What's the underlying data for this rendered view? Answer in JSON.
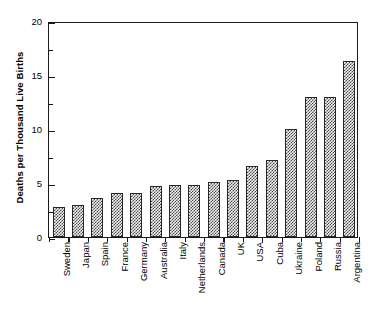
{
  "chart_data": {
    "type": "bar",
    "title": "",
    "xlabel": "",
    "ylabel": "Deaths per Thousand Live Births",
    "ylim": [
      0,
      20
    ],
    "ytick_values": [
      0,
      5,
      10,
      15,
      20
    ],
    "ytick_labels": [
      "0",
      "5",
      "10",
      "15",
      "20"
    ],
    "yminor_step": 2.5,
    "grid": false,
    "legend": null,
    "categories": [
      "Sweden",
      "Japan",
      "Spain",
      "France",
      "Germany",
      "Australia",
      "Italy",
      "Netherlands",
      "Canada",
      "UK",
      "USA",
      "Cuba",
      "Ukraine",
      "Poland",
      "Russia",
      "Argentina"
    ],
    "values": [
      2.8,
      3.0,
      3.6,
      4.1,
      4.1,
      4.7,
      4.8,
      4.85,
      5.05,
      5.3,
      6.6,
      7.1,
      10.0,
      13.0,
      13.0,
      16.3
    ],
    "bar_style": {
      "fill_pattern": "checkerboard",
      "fill_color": "#f2f2f2",
      "pattern_color": "#4a4a4a",
      "edge_color": "#262626"
    }
  },
  "axes": {
    "frame_color": "#1a1a1a",
    "background": "#ffffff"
  }
}
